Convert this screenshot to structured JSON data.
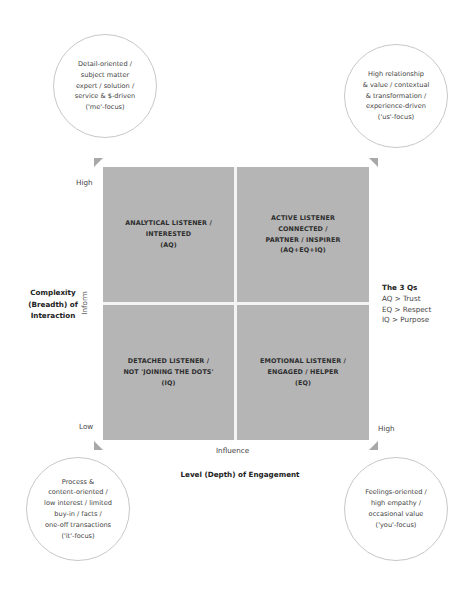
{
  "circles": {
    "top_left": {
      "lines": [
        "Detail-oriented /",
        "subject matter",
        "expert / solution /",
        "service & $-driven",
        "('me'-focus)"
      ]
    },
    "top_right": {
      "lines": [
        "High relationship",
        "& value / contextual",
        "& transformation /",
        "experience-driven",
        "('us'-focus)"
      ]
    },
    "bottom_left": {
      "lines": [
        "Process &",
        "content-oriented /",
        "low interest / limited",
        "buy-in / facts /",
        "one-off transactions",
        "('it'-focus)"
      ]
    },
    "bottom_right": {
      "lines": [
        "Feelings-oriented /",
        "high empathy /",
        "occasional value",
        "('you'-focus)"
      ]
    }
  },
  "quadrants": {
    "top_left": {
      "lines": [
        "ANALYTICAL LISTENER /",
        "INTERESTED",
        "(AQ)"
      ]
    },
    "top_right": {
      "lines": [
        "ACTIVE LISTENER",
        "CONNECTED /",
        "PARTNER / INSPIRER",
        "(AQ+EQ+IQ)"
      ]
    },
    "bottom_left": {
      "lines": [
        "DETACHED LISTENER /",
        "NOT 'JOINING THE DOTS'",
        "(IQ)"
      ]
    },
    "bottom_right": {
      "lines": [
        "EMOTIONAL LISTENER /",
        "ENGAGED / HELPER",
        "(EQ)"
      ]
    }
  },
  "axes": {
    "y_high": "High",
    "y_low": "Low",
    "y_mid": "Inform",
    "x_high": "High",
    "x_mid": "Influence",
    "y_title": [
      "Complexity",
      "(Breadth) of",
      "Interaction"
    ],
    "x_title": "Level (Depth) of Engagement"
  },
  "three_qs": {
    "title": "The 3 Qs",
    "items": [
      "AQ > Trust",
      "EQ > Respect",
      "IQ > Purpose"
    ]
  },
  "colors": {
    "grid": "#b5b5b5",
    "divider": "#f4f4f4",
    "triangle": "#a8a8a8",
    "circle_border": "#c8c8c8"
  }
}
